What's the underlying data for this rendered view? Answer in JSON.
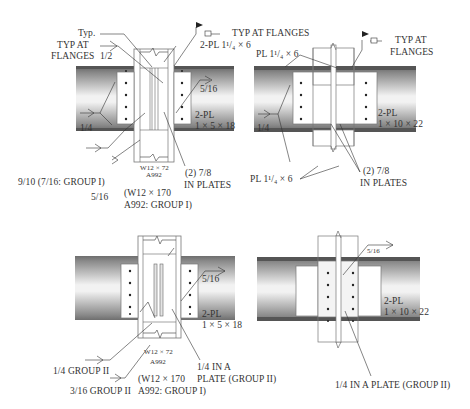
{
  "figure": {
    "panels": [
      {
        "id": "top-left",
        "labels": {
          "typ": "Typ.",
          "typ_at_flanges_left_1": "TYP AT",
          "typ_at_flanges_left_2": "FLANGES",
          "weld_half": "1/2",
          "typ_at_flanges_right": "TYP AT FLANGES",
          "plate_top": "2-PL 1¹/₄ × 6",
          "weld_5_16": "5/16",
          "weld_1_4": "1/4",
          "side_plate_1": "2-PL",
          "side_plate_2": "1 × 5 × 18",
          "column_1": "W12 × 72",
          "column_2": "A992",
          "bolts_1": "(2) 7/8",
          "bolts_2": "IN PLATES",
          "weld_9_10": "9/10 (7/16: GROUP I)",
          "weld_5_16_b": "5/16",
          "beam_1": "(W12 × 170",
          "beam_2": "A992: GROUP I)"
        }
      },
      {
        "id": "top-right",
        "labels": {
          "pl_top": "PL 1¹/₄ × 6",
          "typ_at_1": "TYP AT",
          "typ_at_2": "FLANGES",
          "weld_1_4": "1/4",
          "side_plate_1": "2-PL",
          "side_plate_2": "1 × 10 × 22",
          "pl_bottom": "PL 1¹/₄ × 6",
          "bolts_1": "(2) 7/8",
          "bolts_2": "IN PLATES"
        }
      },
      {
        "id": "bottom-left",
        "labels": {
          "weld_5_16": "5/16",
          "side_plate_1": "2-PL",
          "side_plate_2": "1 × 5 × 18",
          "column_1": "W12 × 72",
          "column_2": "A992",
          "weld_group2_1": "1/4 IN A",
          "weld_group2_2": "PLATE (GROUP II)",
          "weld_1_4_g2": "1/4 GROUP II",
          "weld_3_16_g2": "3/16 GROUP II",
          "beam_1": "(W12 × 170",
          "beam_2": "A992: GROUP I)"
        }
      },
      {
        "id": "bottom-right",
        "labels": {
          "weld_5_16": "5/16",
          "side_plate_1": "2-PL",
          "side_plate_2": "1 × 10 × 22",
          "weld_plate": "1/4 IN A PLATE (GROUP II)"
        }
      }
    ]
  }
}
